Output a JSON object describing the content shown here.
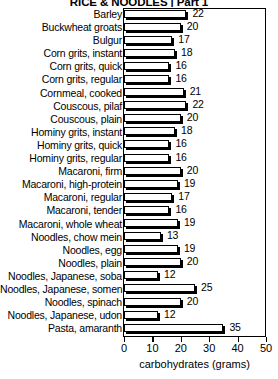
{
  "chart_data": {
    "type": "bar",
    "orientation": "horizontal",
    "title": "RICE & NOODLES | Part 1",
    "xlabel": "carbohydrates (grams)",
    "ylabel": "",
    "xlim": [
      0,
      50
    ],
    "xticks": [
      0,
      10,
      20,
      30,
      40,
      50
    ],
    "grid": false,
    "legend": null,
    "categories": [
      "Barley",
      "Buckwheat groats",
      "Bulgur",
      "Corn grits, instant",
      "Corn grits, quick",
      "Corn grits, regular",
      "Cornmeal, cooked",
      "Couscous, pilaf",
      "Couscous, plain",
      "Hominy grits, instant",
      "Hominy grits, quick",
      "Hominy grits, regular",
      "Macaroni, firm",
      "Macaroni, high-protein",
      "Macaroni, regular",
      "Macaroni, tender",
      "Macaroni, whole wheat",
      "Noodles, chow mein",
      "Noodles, egg",
      "Noodles, plain",
      "Noodles, Japanese, soba",
      "Noodles, Japanese, somen",
      "Noodles, spinach",
      "Noodles, Japanese, udon",
      "Pasta, amaranth"
    ],
    "values": [
      22,
      20,
      17,
      18,
      16,
      16,
      21,
      22,
      20,
      18,
      16,
      16,
      20,
      19,
      17,
      16,
      19,
      13,
      19,
      20,
      12,
      25,
      20,
      12,
      35
    ],
    "value_labels": [
      "22",
      "20",
      "17",
      "18",
      "16",
      "16",
      "21",
      "22",
      "20",
      "18",
      "16",
      "16",
      "20",
      "19",
      "17",
      "16",
      "19",
      "13",
      "19",
      "20",
      "12",
      "25",
      "20",
      "12",
      "35"
    ],
    "bar_fill_color": "#ffffff",
    "bar_edge_color": "#000000",
    "shadow_color": "#000000",
    "background_color": "#ffffff"
  }
}
